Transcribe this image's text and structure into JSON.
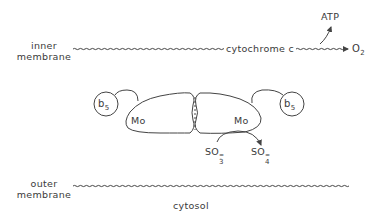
{
  "diagram": {
    "membranes": {
      "inner": {
        "label_line1": "inner",
        "label_line2": "membrane"
      },
      "outer": {
        "label_line1": "outer",
        "label_line2": "membrane"
      }
    },
    "electron_path": {
      "carrier": "cytochrome c",
      "acceptor": "O",
      "acceptor_subscript": "2",
      "product": "ATP"
    },
    "enzyme": {
      "subunits": [
        {
          "cofactor": "Mo",
          "heme_domain": "b",
          "heme_subscript": "5"
        },
        {
          "cofactor": "Mo",
          "heme_domain": "b",
          "heme_subscript": "5"
        }
      ]
    },
    "reaction": {
      "substrate": "SO",
      "substrate_subscript": "3",
      "substrate_charge": "=",
      "product": "SO",
      "product_subscript": "4",
      "product_charge": "="
    },
    "compartment": "cytosol"
  },
  "colors": {
    "line": "#444444",
    "text": "#3a3a3a",
    "background": "#ffffff"
  }
}
